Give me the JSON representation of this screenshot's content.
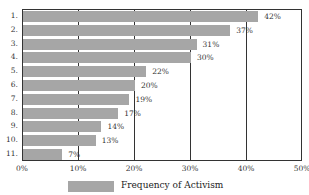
{
  "chart_data": {
    "type": "bar",
    "orientation": "horizontal",
    "title": "",
    "xlabel": "",
    "ylabel": "",
    "categories": [
      "1.",
      "2.",
      "3.",
      "4.",
      "5.",
      "6.",
      "7.",
      "8.",
      "9.",
      "10.",
      "11."
    ],
    "series": [
      {
        "name": "Frequency of Activism",
        "values": [
          42,
          37,
          31,
          30,
          22,
          20,
          19,
          17,
          14,
          13,
          7
        ],
        "color": "#a6a6a6"
      }
    ],
    "value_labels": [
      "42%",
      "37%",
      "31%",
      "30%",
      "22%",
      "20%",
      "19%",
      "17%",
      "14%",
      "13%",
      "7%"
    ],
    "xlim": [
      0,
      50
    ],
    "x_ticks": [
      "0%",
      "10%",
      "20%",
      "30%",
      "40%",
      "50%"
    ],
    "grid": "vertical",
    "legend_position": "bottom"
  },
  "legend": {
    "label": "Frequency of Activism"
  }
}
